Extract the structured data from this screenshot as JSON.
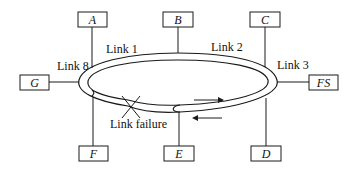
{
  "diagram": {
    "type": "dual-ring network with link failure and wrap-around",
    "nodes": [
      {
        "id": "A",
        "label": "A",
        "x": 78,
        "y": 12,
        "w": 29,
        "h": 15,
        "attach": [
          92,
          27,
          92,
          68
        ]
      },
      {
        "id": "B",
        "label": "B",
        "x": 163,
        "y": 12,
        "w": 30,
        "h": 15,
        "attach": [
          178,
          27,
          178,
          53
        ]
      },
      {
        "id": "C",
        "label": "C",
        "x": 250,
        "y": 12,
        "w": 30,
        "h": 15,
        "attach": [
          265,
          27,
          265,
          67
        ]
      },
      {
        "id": "G",
        "label": "G",
        "x": 20,
        "y": 75,
        "w": 29,
        "h": 15,
        "attach": [
          49,
          82,
          79,
          82
        ]
      },
      {
        "id": "FS",
        "label": "FS",
        "x": 309,
        "y": 75,
        "w": 29,
        "h": 15,
        "attach": [
          277,
          82,
          309,
          82
        ]
      },
      {
        "id": "F",
        "label": "F",
        "x": 79,
        "y": 146,
        "w": 29,
        "h": 15,
        "attach": [
          93,
          97,
          93,
          146
        ]
      },
      {
        "id": "E",
        "label": "E",
        "x": 164,
        "y": 146,
        "w": 30,
        "h": 15,
        "attach": [
          179,
          112,
          179,
          146
        ]
      },
      {
        "id": "D",
        "label": "D",
        "x": 251,
        "y": 146,
        "w": 30,
        "h": 15,
        "attach": [
          266,
          98,
          266,
          146
        ]
      }
    ],
    "links": [
      {
        "label": "Link 1",
        "x": 106,
        "y": 53
      },
      {
        "label": "Link 2",
        "x": 211,
        "y": 51
      },
      {
        "label": "Link 3",
        "x": 277,
        "y": 69
      },
      {
        "label": "Link 8",
        "x": 57,
        "y": 70
      }
    ],
    "failure": {
      "label": "Link failure",
      "x": 110,
      "y": 128
    },
    "colors": {
      "stroke": "#1a1a1a",
      "background": "#ffffff",
      "text": "#111111"
    }
  }
}
